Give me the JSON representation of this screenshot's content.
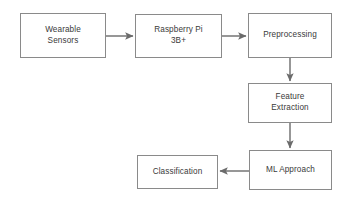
{
  "diagram": {
    "type": "flowchart",
    "orientation": "left-to-right then top-to-bottom then right-to-left",
    "colors": {
      "background": "#ffffff",
      "box_border": "#8a8a8a",
      "box_fill": "#ffffff",
      "text": "#3a3a3a",
      "arrow": "#6b6b6b"
    },
    "nodes": [
      {
        "id": "wearable-sensors",
        "label": "Wearable\nSensors",
        "x": 20,
        "y": 13,
        "w": 86,
        "h": 45
      },
      {
        "id": "raspberry-pi-3b-plus",
        "label": "Raspberry Pi\n3B+",
        "x": 135,
        "y": 14,
        "w": 87,
        "h": 44
      },
      {
        "id": "preprocessing",
        "label": "Preprocessing",
        "x": 248,
        "y": 13,
        "w": 84,
        "h": 45
      },
      {
        "id": "feature-extraction",
        "label": "Feature\nExtraction",
        "x": 248,
        "y": 83,
        "w": 84,
        "h": 40
      },
      {
        "id": "ml-approach",
        "label": "ML Approach",
        "x": 249,
        "y": 150,
        "w": 83,
        "h": 40
      },
      {
        "id": "classification",
        "label": "Classification",
        "x": 137,
        "y": 155,
        "w": 81,
        "h": 34
      }
    ],
    "edges": [
      {
        "id": "sensors-to-pi",
        "from": "wearable-sensors",
        "to": "raspberry-pi-3b-plus",
        "direction": "right",
        "x1": 106,
        "y1": 36,
        "x2": 133,
        "y2": 36
      },
      {
        "id": "pi-to-preprocessing",
        "from": "raspberry-pi-3b-plus",
        "to": "preprocessing",
        "direction": "right",
        "x1": 222,
        "y1": 36,
        "x2": 246,
        "y2": 36
      },
      {
        "id": "preprocessing-to-feature-extraction",
        "from": "preprocessing",
        "to": "feature-extraction",
        "direction": "down",
        "x1": 290,
        "y1": 58,
        "x2": 290,
        "y2": 81
      },
      {
        "id": "feature-extraction-to-ml-approach",
        "from": "feature-extraction",
        "to": "ml-approach",
        "direction": "down",
        "x1": 290,
        "y1": 123,
        "x2": 290,
        "y2": 148
      },
      {
        "id": "ml-approach-to-classification",
        "from": "ml-approach",
        "to": "classification",
        "direction": "left",
        "x1": 249,
        "y1": 171,
        "x2": 220,
        "y2": 171
      }
    ]
  }
}
